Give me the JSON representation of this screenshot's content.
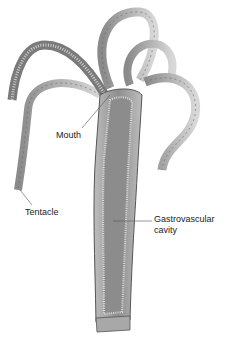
{
  "diagram": {
    "labels": {
      "mouth": "Mouth",
      "tentacle": "Tentacle",
      "gastro_line1": "Gastrovascular",
      "gastro_line2": "cavity"
    },
    "colors": {
      "body_fill": "#9a9a9a",
      "body_light": "#c8c8c8",
      "outline": "#555555",
      "cavity": "#8c8c8c"
    }
  }
}
